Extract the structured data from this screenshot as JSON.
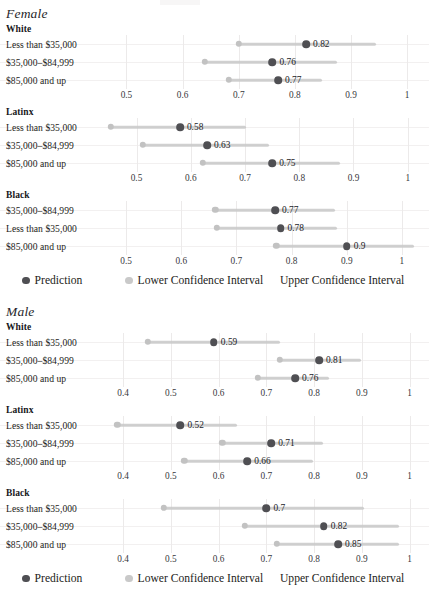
{
  "chart_data": {
    "type": "scatter",
    "title": "",
    "xlabel": "",
    "ylabel": "",
    "grid": true,
    "legend_position": "bottom",
    "series_names": [
      "Prediction",
      "Lower Confidence Interval",
      "Upper Confidence Interval"
    ],
    "colors": {
      "prediction": "#4f4f53",
      "lower_ci": "#c2c2c2",
      "ci_bar": "#c8c8c8",
      "gridline": "#eceaea",
      "text": "#1d1d20"
    },
    "panels": [
      {
        "sex": "Female",
        "races": [
          {
            "race": "White",
            "xlim": [
              0.46,
              1.03
            ],
            "ticks": [
              0.5,
              0.6,
              0.7,
              0.8,
              0.9,
              1
            ],
            "tick_labels": [
              "0.5",
              "0.6",
              "0.7",
              "0.8",
              "0.9",
              "1"
            ],
            "rows": [
              {
                "label": "Less than $35,000",
                "prediction": 0.82,
                "value_label": "0.82",
                "lower": 0.7,
                "upper": 0.945
              },
              {
                "label": "$35,000–$84,999",
                "prediction": 0.76,
                "value_label": "0.76",
                "lower": 0.64,
                "upper": 0.875
              },
              {
                "label": "$85,000 and up",
                "prediction": 0.77,
                "value_label": "0.77",
                "lower": 0.682,
                "upper": 0.848
              }
            ]
          },
          {
            "race": "Latinx",
            "xlim": [
              0.44,
              1.03
            ],
            "ticks": [
              0.5,
              0.6,
              0.7,
              0.8,
              0.9,
              1
            ],
            "tick_labels": [
              "0.5",
              "0.6",
              "0.7",
              "0.8",
              "0.9",
              "1"
            ],
            "rows": [
              {
                "label": "Less than $35,000",
                "prediction": 0.58,
                "value_label": "0.58",
                "lower": 0.452,
                "upper": 0.702
              },
              {
                "label": "$35,000–$84,999",
                "prediction": 0.63,
                "value_label": "0.63",
                "lower": 0.512,
                "upper": 0.745
              },
              {
                "label": "$85,000 and up",
                "prediction": 0.75,
                "value_label": "0.75",
                "lower": 0.622,
                "upper": 0.875
              }
            ]
          },
          {
            "race": "Black",
            "xlim": [
              0.46,
              1.04
            ],
            "ticks": [
              0.5,
              0.6,
              0.7,
              0.8,
              0.9,
              1
            ],
            "tick_labels": [
              "0.5",
              "0.6",
              "0.7",
              "0.8",
              "0.9",
              "1"
            ],
            "rows": [
              {
                "label": "$35,000–$84,999",
                "prediction": 0.77,
                "value_label": "0.77",
                "lower": 0.662,
                "upper": 0.878
              },
              {
                "label": "Less than $35,000",
                "prediction": 0.78,
                "value_label": "0.78",
                "lower": 0.665,
                "upper": 0.882
              },
              {
                "label": "$85,000 and up",
                "prediction": 0.9,
                "value_label": "0.9",
                "lower": 0.772,
                "upper": 1.022
              }
            ]
          }
        ],
        "legend": [
          {
            "label": "Prediction",
            "marker": "dot-dark"
          },
          {
            "label": "Lower Confidence Interval",
            "marker": "dot-light"
          },
          {
            "label": "Upper Confidence Interval",
            "marker": "none"
          }
        ]
      },
      {
        "sex": "Male",
        "races": [
          {
            "race": "White",
            "xlim": [
              0.36,
              1.03
            ],
            "ticks": [
              0.4,
              0.5,
              0.6,
              0.7,
              0.8,
              0.9,
              1
            ],
            "tick_labels": [
              "0.4",
              "0.5",
              "0.6",
              "0.7",
              "0.8",
              "0.9",
              "1"
            ],
            "rows": [
              {
                "label": "Less than $35,000",
                "prediction": 0.59,
                "value_label": "0.59",
                "lower": 0.452,
                "upper": 0.728
              },
              {
                "label": "$35,000–$84,999",
                "prediction": 0.81,
                "value_label": "0.81",
                "lower": 0.728,
                "upper": 0.898
              },
              {
                "label": "$85,000 and up",
                "prediction": 0.76,
                "value_label": "0.76",
                "lower": 0.682,
                "upper": 0.832
              }
            ]
          },
          {
            "race": "Latinx",
            "xlim": [
              0.36,
              1.03
            ],
            "ticks": [
              0.4,
              0.5,
              0.6,
              0.7,
              0.8,
              0.9,
              1
            ],
            "tick_labels": [
              "0.4",
              "0.5",
              "0.6",
              "0.7",
              "0.8",
              "0.9",
              "1"
            ],
            "rows": [
              {
                "label": "Less than $35,000",
                "prediction": 0.52,
                "value_label": "0.52",
                "lower": 0.388,
                "upper": 0.638
              },
              {
                "label": "$35,000–$84,999",
                "prediction": 0.71,
                "value_label": "0.71",
                "lower": 0.608,
                "upper": 0.818
              },
              {
                "label": "$85,000 and up",
                "prediction": 0.66,
                "value_label": "0.66",
                "lower": 0.528,
                "upper": 0.798
              }
            ]
          },
          {
            "race": "Black",
            "xlim": [
              0.36,
              1.03
            ],
            "ticks": [
              0.4,
              0.5,
              0.6,
              0.7,
              0.8,
              0.9,
              1
            ],
            "tick_labels": [
              "0.4",
              "0.5",
              "0.6",
              "0.7",
              "0.8",
              "0.9",
              "1"
            ],
            "rows": [
              {
                "label": "Less than $35,000",
                "prediction": 0.7,
                "value_label": "0.7",
                "lower": 0.485,
                "upper": 0.905
              },
              {
                "label": "$35,000–$84,999",
                "prediction": 0.82,
                "value_label": "0.82",
                "lower": 0.655,
                "upper": 0.978
              },
              {
                "label": "$85,000 and up",
                "prediction": 0.85,
                "value_label": "0.85",
                "lower": 0.722,
                "upper": 0.978
              }
            ]
          }
        ],
        "legend": [
          {
            "label": "Prediction",
            "marker": "dot-dark"
          },
          {
            "label": "Lower Confidence Interval",
            "marker": "dot-light"
          },
          {
            "label": "Upper Confidence Interval",
            "marker": "none"
          }
        ]
      }
    ]
  }
}
